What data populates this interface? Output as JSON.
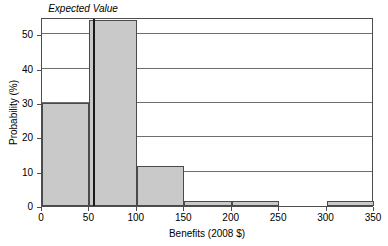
{
  "chart_data": {
    "type": "bar",
    "title": "",
    "subtitle": "",
    "xlabel": "Benefits (2008 $)",
    "ylabel": "Probability (%)",
    "xlim": [
      0,
      350
    ],
    "ylim": [
      0,
      55
    ],
    "grid": true,
    "legend": null,
    "bin_width": 50,
    "bin_edges": [
      0,
      50,
      100,
      150,
      200,
      250,
      300,
      350
    ],
    "categories": [
      "0-50",
      "50-100",
      "100-150",
      "150-200",
      "200-250",
      "250-300",
      "300-350"
    ],
    "values": [
      30,
      54,
      11.5,
      1.5,
      1.5,
      0,
      1.5
    ],
    "xticks": [
      0,
      50,
      100,
      150,
      200,
      250,
      300,
      350
    ],
    "xticklabels": [
      "0",
      "50",
      "100",
      "150",
      "200",
      "250",
      "300",
      "350"
    ],
    "yticks": [
      0,
      10,
      20,
      30,
      40,
      50
    ],
    "yticklabels": [
      "0",
      "10",
      "20",
      "30",
      "40",
      "50"
    ],
    "gridline_values": [
      10,
      20,
      30,
      40,
      50
    ],
    "annotations": [
      {
        "name": "expected-value",
        "label": "Expected Value",
        "x": 55,
        "style": "vertical-line",
        "italic": true
      }
    ],
    "colors": {
      "bar_fill": "#c9c9c9",
      "bar_edge": "#4a4a4a",
      "gridline": "#6e6e6e",
      "axis": "#4d4d4d",
      "annotation_line": "#1a1a1a",
      "background": "#ffffff",
      "text": "#000000"
    }
  }
}
